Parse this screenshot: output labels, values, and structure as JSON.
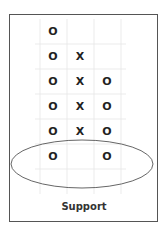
{
  "diagram": {
    "title": "Support",
    "type": "point-and-figure",
    "columns": [
      [
        "O",
        "O",
        "O",
        "O",
        "O"
      ],
      [
        "",
        "X",
        "X",
        "X",
        ""
      ],
      [
        "",
        "",
        "O",
        "O",
        "O"
      ]
    ],
    "rows": [
      [
        "O",
        "",
        ""
      ],
      [
        "O",
        "X",
        ""
      ],
      [
        "O",
        "X",
        "O"
      ],
      [
        "O",
        "X",
        "O"
      ],
      [
        "O",
        "X",
        "O"
      ],
      [
        "O",
        "",
        "O"
      ]
    ],
    "highlight": {
      "shape": "ellipse",
      "row": 5,
      "meaning": "support level"
    }
  }
}
